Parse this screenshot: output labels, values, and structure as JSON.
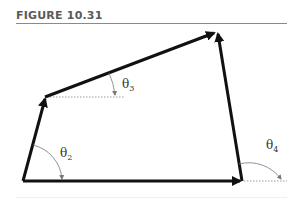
{
  "figure": {
    "label": "FIGURE 10.31"
  },
  "diagram": {
    "vectors": [
      {
        "id": "r1",
        "from": "A",
        "to": "B",
        "description": "ground link, horizontal"
      },
      {
        "id": "r2",
        "from": "A",
        "to": "C",
        "description": "input link"
      },
      {
        "id": "r3",
        "from": "C",
        "to": "D",
        "description": "coupler link"
      },
      {
        "id": "r4",
        "from": "B",
        "to": "D",
        "description": "output link"
      }
    ],
    "angles": [
      {
        "symbol": "θ",
        "subscript": "2",
        "name": "theta-2"
      },
      {
        "symbol": "θ",
        "subscript": "3",
        "name": "theta-3"
      },
      {
        "symbol": "θ",
        "subscript": "4",
        "name": "theta-4"
      }
    ],
    "colors": {
      "link": "#111111",
      "reference_line": "#9a9a9a",
      "angle_arc": "#777777",
      "label": "#333333"
    }
  }
}
